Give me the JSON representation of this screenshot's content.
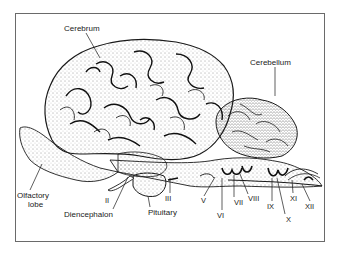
{
  "figure": {
    "labels": {
      "cerebrum": "Cerebrum",
      "cerebellum": "Cerebellum",
      "olfactory_lobe_line1": "Olfactory",
      "olfactory_lobe_line2": "lobe",
      "diencephalon": "Diencephalon",
      "pituitary": "Pituitary"
    },
    "cranial_nerves": [
      "II",
      "III",
      "V",
      "VI",
      "VII",
      "VIII",
      "IX",
      "X",
      "XI",
      "XII"
    ],
    "colors": {
      "ink": "#1a1a1a",
      "frame": "#6a6a6a",
      "background": "#ffffff"
    }
  }
}
